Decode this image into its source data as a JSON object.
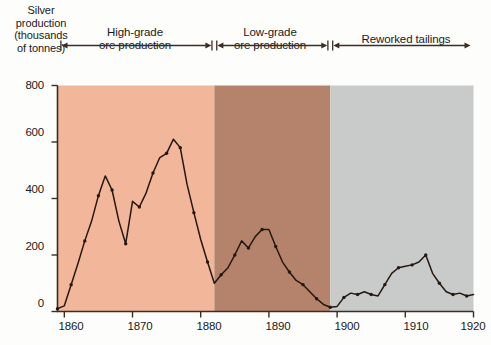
{
  "axes": {
    "y_title": "Silver\nproduction\n(thousands\nof tonnes)",
    "y_ticks": [
      "0",
      "200",
      "400",
      "600",
      "800"
    ],
    "x_ticks": [
      "1860",
      "1870",
      "1880",
      "1890",
      "1900",
      "1910",
      "1920"
    ]
  },
  "phases": [
    {
      "label": "High-grade\nore production"
    },
    {
      "label": "Low-grade\nore production"
    },
    {
      "label": "Reworked tailings"
    }
  ],
  "annotations": [
    {
      "label": "Ophir, Gould,\nand Curry\nBonanzas"
    },
    {
      "label": "Upper-level\nlow-grade ore"
    },
    {
      "label": "New process\ndeveloped"
    }
  ],
  "colors": {
    "band_high_grade": "#f2b69a",
    "band_low_grade": "#b5836b",
    "band_tailings": "#c9cbca",
    "line": "#241810",
    "frame": "#3a2d24",
    "page": "#fdfdfb"
  },
  "chart_data": {
    "type": "line",
    "title": "",
    "xlabel": "",
    "ylabel": "Silver production (thousands of tonnes)",
    "xlim": [
      1859,
      1920
    ],
    "ylim": [
      0,
      800
    ],
    "ytick_values": [
      0,
      200,
      400,
      600,
      800
    ],
    "xtick_values": [
      1860,
      1870,
      1880,
      1890,
      1900,
      1910,
      1920
    ],
    "grid": false,
    "legend": false,
    "markers": true,
    "bands": [
      {
        "name": "High-grade ore production",
        "x_start": 1859,
        "x_end": 1882,
        "color": "#f2b69a"
      },
      {
        "name": "Low-grade ore production",
        "x_start": 1882,
        "x_end": 1899,
        "color": "#b5836b"
      },
      {
        "name": "Reworked tailings",
        "x_start": 1899,
        "x_end": 1920,
        "color": "#c9cbca"
      }
    ],
    "series": [
      {
        "name": "Silver production",
        "x": [
          1859,
          1860,
          1861,
          1862,
          1863,
          1864,
          1865,
          1866,
          1867,
          1868,
          1869,
          1870,
          1871,
          1872,
          1873,
          1874,
          1875,
          1876,
          1877,
          1878,
          1879,
          1880,
          1881,
          1882,
          1883,
          1884,
          1885,
          1886,
          1887,
          1888,
          1889,
          1890,
          1891,
          1892,
          1893,
          1894,
          1895,
          1896,
          1897,
          1898,
          1899,
          1900,
          1901,
          1902,
          1903,
          1904,
          1905,
          1906,
          1907,
          1908,
          1909,
          1910,
          1911,
          1912,
          1913,
          1914,
          1915,
          1916,
          1917,
          1918,
          1919,
          1920
        ],
        "values": [
          10,
          20,
          95,
          170,
          250,
          320,
          410,
          480,
          430,
          320,
          240,
          390,
          370,
          420,
          490,
          545,
          560,
          610,
          580,
          450,
          350,
          255,
          175,
          100,
          130,
          155,
          200,
          250,
          225,
          265,
          290,
          290,
          230,
          175,
          140,
          110,
          95,
          70,
          45,
          25,
          15,
          18,
          50,
          65,
          60,
          70,
          60,
          55,
          95,
          135,
          155,
          160,
          165,
          175,
          200,
          135,
          100,
          70,
          60,
          65,
          55,
          60
        ]
      }
    ]
  }
}
